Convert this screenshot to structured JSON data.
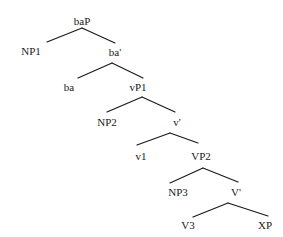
{
  "diagram": {
    "type": "syntax-tree",
    "nodes": {
      "baP": "baP",
      "NP1": "NP1",
      "ba_bar": "ba'",
      "ba": "ba",
      "vP1": "vP1",
      "NP2": "NP2",
      "v_bar": "v'",
      "v1": "v1",
      "VP2": "VP2",
      "NP3": "NP3",
      "V_bar": "V'",
      "V3": "V3",
      "XP": "XP"
    },
    "edges": [
      [
        "baP",
        "NP1"
      ],
      [
        "baP",
        "ba'"
      ],
      [
        "ba'",
        "ba"
      ],
      [
        "ba'",
        "vP1"
      ],
      [
        "vP1",
        "NP2"
      ],
      [
        "vP1",
        "v'"
      ],
      [
        "v'",
        "v1"
      ],
      [
        "v'",
        "VP2"
      ],
      [
        "VP2",
        "NP3"
      ],
      [
        "VP2",
        "V'"
      ],
      [
        "V'",
        "V3"
      ],
      [
        "V'",
        "XP"
      ]
    ],
    "colors": {
      "line": "#1a1a1a",
      "text": "#1a1a1a",
      "background": "#ffffff"
    }
  }
}
